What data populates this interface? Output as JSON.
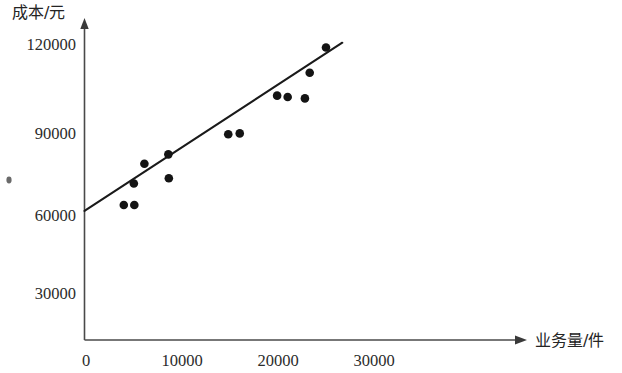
{
  "chart_data": {
    "type": "scatter",
    "title": "",
    "subtitle": "",
    "xlabel": "业务量/件",
    "ylabel": "成本/元",
    "xlim": [
      0,
      32000
    ],
    "ylim": [
      0,
      127000
    ],
    "grid": false,
    "legend": null,
    "x_ticks": [
      {
        "value": 0,
        "label": "0"
      },
      {
        "value": 10000,
        "label": "10000"
      },
      {
        "value": 20000,
        "label": "20000"
      },
      {
        "value": 30000,
        "label": "30000"
      }
    ],
    "y_ticks": [
      {
        "value": 30000,
        "label": "30000"
      },
      {
        "value": 60000,
        "label": "60000"
      },
      {
        "value": 90000,
        "label": "90000"
      },
      {
        "value": 120000,
        "label": "120000"
      }
    ],
    "series": [
      {
        "name": "观测值",
        "type": "scatter",
        "marker": "filled-circle",
        "color": "#141414",
        "points": [
          {
            "x": 4100,
            "y": 62100
          },
          {
            "x": 5200,
            "y": 62100
          },
          {
            "x": 5150,
            "y": 69900
          },
          {
            "x": 6250,
            "y": 77100
          },
          {
            "x": 8750,
            "y": 80500
          },
          {
            "x": 8800,
            "y": 71800
          },
          {
            "x": 15000,
            "y": 87800
          },
          {
            "x": 16200,
            "y": 88100
          },
          {
            "x": 20100,
            "y": 101800
          },
          {
            "x": 21200,
            "y": 101300
          },
          {
            "x": 23000,
            "y": 100800
          },
          {
            "x": 23500,
            "y": 110100
          },
          {
            "x": 25200,
            "y": 119300
          }
        ]
      },
      {
        "name": "回归直线",
        "type": "line",
        "color": "#1a1a1a",
        "x_start": 0,
        "y_start": 60000,
        "x_end": 26900,
        "y_end": 121000
      }
    ]
  },
  "axes": {
    "y_title": "成本/元",
    "x_title": "业务量/件"
  }
}
